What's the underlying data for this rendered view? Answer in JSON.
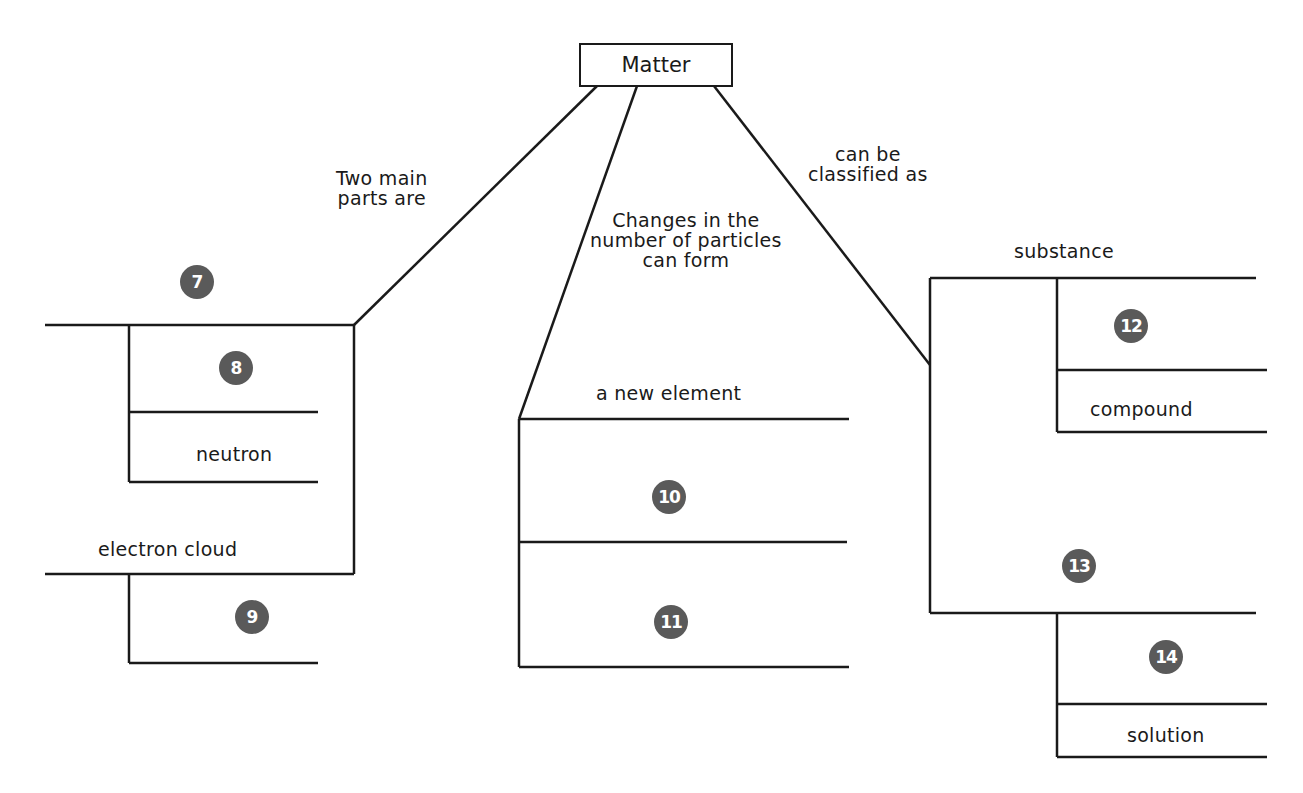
{
  "diagram": {
    "type": "concept map",
    "root": "Matter",
    "links": {
      "left": "Two main\nparts are",
      "middle": "Changes in the\nnumber of particles\ncan form",
      "right": "can be\nclassified as"
    },
    "left_branch": {
      "blank_top": "7",
      "blank_sub1": "8",
      "sub2": "neutron",
      "second_part": "electron cloud",
      "blank_sub3": "9"
    },
    "middle_branch": {
      "label": "a new element",
      "blank_a": "10",
      "blank_b": "11"
    },
    "right_branch": {
      "label": "substance",
      "blank_sub1": "12",
      "sub2": "compound",
      "blank_mix": "13",
      "blank_sub3": "14",
      "sub4": "solution"
    }
  },
  "colors": {
    "line": "#1a1a1a",
    "badge": "#5a5a5a",
    "badge_text": "#ffffff"
  }
}
